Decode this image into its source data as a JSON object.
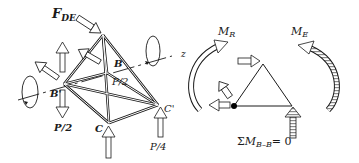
{
  "figure": {
    "left_panel": {
      "force_label": "F",
      "force_sub": "DE",
      "node_b_label": "B",
      "node_b_prime_label": "B'",
      "node_c_label": "C",
      "node_c_prime_label": "C'",
      "load_b_prime": "P/2",
      "load_b": "P/2",
      "load_c_prime": "P/4",
      "axis_label": "z"
    },
    "right_panel": {
      "moment_r_label": "M",
      "moment_r_sub": "R",
      "moment_e_label": "M",
      "moment_e_sub": "E",
      "equation_sigma": "Σ",
      "equation_m": "M",
      "equation_sub": "B–B",
      "equation_rhs": "= 0"
    },
    "colors": {
      "line": "#1a1a1a",
      "hatch": "#888888",
      "background": "#ffffff"
    }
  }
}
